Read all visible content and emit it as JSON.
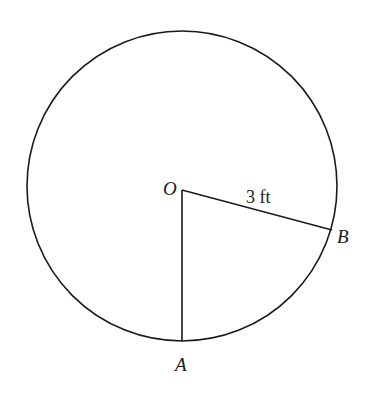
{
  "diagram": {
    "circle": {
      "cx": 182,
      "cy": 186,
      "r": 155,
      "stroke": "#1a1a1a"
    },
    "center_label": "O",
    "point_a_label": "A",
    "point_b_label": "B",
    "radius_label": "3 ft"
  }
}
